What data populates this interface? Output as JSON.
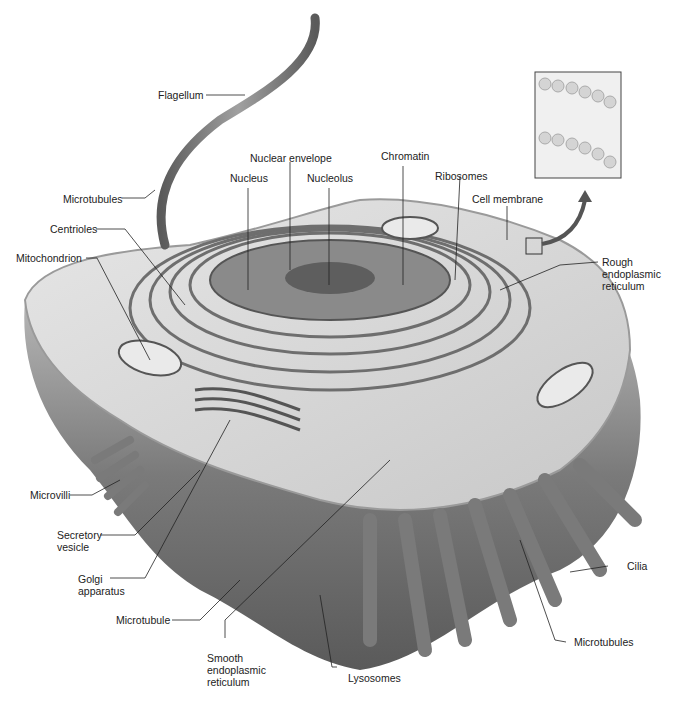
{
  "figure": {
    "inset": "Cell membrane phospholipid bilayer detail"
  },
  "labels": {
    "flagellum": "Flagellum",
    "microtubules_top": "Microtubules",
    "centrioles": "Centrioles",
    "mitochondrion": "Mitochondrion",
    "nuclear_envelope": "Nuclear envelope",
    "nucleus": "Nucleus",
    "nucleolus": "Nucleolus",
    "chromatin": "Chromatin",
    "ribosomes": "Ribosomes",
    "cell_membrane": "Cell membrane",
    "rough_er": "Rough\nendoplasmic\nreticulum",
    "microvilli": "Microvilli",
    "secretory_vesicle": "Secretory\nvesicle",
    "golgi": "Golgi\napparatus",
    "microtubule": "Microtubule",
    "smooth_er": "Smooth\nendoplasmic\nreticulum",
    "lysosomes": "Lysosomes",
    "microtubules_bottom": "Microtubules",
    "cilia": "Cilia"
  },
  "colors": {
    "cell_body": "#9a9a9a",
    "cytoplasm": "#d8d8d8",
    "dark": "#4a4a4a",
    "leader_line": "#222222"
  }
}
